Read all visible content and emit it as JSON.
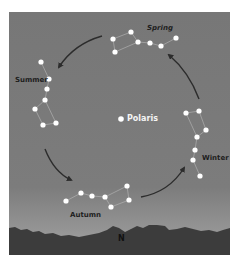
{
  "diagram": {
    "title": "",
    "center_star": {
      "label": "Polaris",
      "x": 112,
      "y": 107
    },
    "compass": {
      "label": "N"
    },
    "colors": {
      "sky_top": "#777777",
      "sky_mid": "#7c7c7c",
      "sky_horizon": "#a8a8a8",
      "ground": "#3c3c3c",
      "arrow": "#2c2c2c",
      "star": "#ffffff",
      "constellation_line": "#b8b8b8",
      "label": "#1e1e1e"
    },
    "constellations": [
      {
        "season": "Spring",
        "label_pos": {
          "x": 138,
          "y": 13
        },
        "stars": [
          [
            104,
            27
          ],
          [
            122,
            20
          ],
          [
            129,
            30
          ],
          [
            141,
            31
          ],
          [
            152,
            34
          ],
          [
            167,
            26
          ],
          [
            106,
            40
          ]
        ],
        "lines": [
          [
            0,
            1
          ],
          [
            1,
            2
          ],
          [
            2,
            3
          ],
          [
            3,
            4
          ],
          [
            4,
            5
          ],
          [
            2,
            6
          ],
          [
            6,
            0
          ]
        ]
      },
      {
        "season": "Summer",
        "label_pos": {
          "x": 6,
          "y": 65
        },
        "stars": [
          [
            32,
            50
          ],
          [
            40,
            67
          ],
          [
            38,
            77
          ],
          [
            36,
            88
          ],
          [
            26,
            97
          ],
          [
            34,
            113
          ],
          [
            47,
            111
          ]
        ],
        "lines": [
          [
            0,
            1
          ],
          [
            1,
            2
          ],
          [
            2,
            3
          ],
          [
            3,
            4
          ],
          [
            4,
            5
          ],
          [
            5,
            6
          ],
          [
            6,
            3
          ]
        ]
      },
      {
        "season": "Winter",
        "label_pos": {
          "x": 193,
          "y": 143
        },
        "stars": [
          [
            177,
            101
          ],
          [
            190,
            99
          ],
          [
            197,
            118
          ],
          [
            188,
            125
          ],
          [
            186,
            138
          ],
          [
            184,
            148
          ],
          [
            191,
            164
          ]
        ],
        "lines": [
          [
            0,
            1
          ],
          [
            1,
            2
          ],
          [
            2,
            3
          ],
          [
            3,
            0
          ],
          [
            3,
            4
          ],
          [
            4,
            5
          ],
          [
            5,
            6
          ]
        ]
      },
      {
        "season": "Autumn",
        "label_pos": {
          "x": 61,
          "y": 200
        },
        "stars": [
          [
            57,
            189
          ],
          [
            72,
            181
          ],
          [
            83,
            184
          ],
          [
            96,
            185
          ],
          [
            102,
            195
          ],
          [
            118,
            174
          ],
          [
            120,
            188
          ]
        ],
        "lines": [
          [
            0,
            1
          ],
          [
            1,
            2
          ],
          [
            2,
            3
          ],
          [
            3,
            4
          ],
          [
            4,
            6
          ],
          [
            6,
            5
          ],
          [
            5,
            3
          ]
        ]
      }
    ],
    "arrows": [
      {
        "from": "Spring",
        "to": "Summer",
        "path": "M 93 24 Q 65 32 50 55"
      },
      {
        "from": "Summer",
        "to": "Autumn",
        "path": "M 36 137 Q 45 160 62 168"
      },
      {
        "from": "Autumn",
        "to": "Winter",
        "path": "M 132 185 Q 160 180 175 156"
      },
      {
        "from": "Winter",
        "to": "Spring",
        "path": "M 190 87 Q 180 60 160 43"
      }
    ]
  }
}
